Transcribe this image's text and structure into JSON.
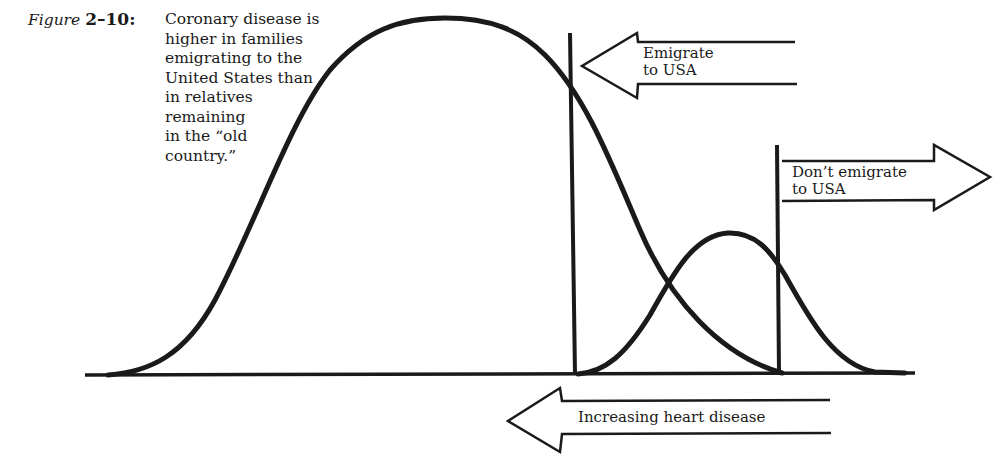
{
  "caption": {
    "figure_word": "Figure",
    "figure_number": "2–10:",
    "lines": [
      "Coronary disease is",
      "higher in families",
      "emigrating to the",
      "United States than",
      "in relatives",
      "remaining",
      "in the “old",
      "country.”"
    ]
  },
  "arrows": {
    "emigrate": {
      "line1": "Emigrate",
      "line2": "to USA",
      "direction": "left"
    },
    "dont_emigrate": {
      "line1": "Don’t emigrate",
      "line2": "to USA",
      "direction": "right"
    },
    "heart_disease": {
      "label": "Increasing heart disease",
      "direction": "left"
    }
  },
  "colors": {
    "ink": "#1a1a1a",
    "background": "#ffffff"
  },
  "diagram": {
    "curves": [
      {
        "name": "large-distribution",
        "peak_x": 445,
        "start_x": 110,
        "end_x": 780,
        "relative_height": "tall"
      },
      {
        "name": "small-distribution",
        "peak_x": 728,
        "start_x": 580,
        "end_x": 900,
        "relative_height": "short"
      }
    ],
    "thresholds": [
      {
        "name": "emigrate-threshold",
        "x": 572
      },
      {
        "name": "dont-emigrate-threshold",
        "x": 778
      }
    ]
  }
}
